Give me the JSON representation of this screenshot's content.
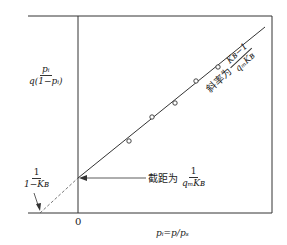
{
  "diagram": {
    "type": "linear-plot-schematic",
    "y_axis_label": {
      "numerator": "pᵢ",
      "denominator": "q(1−pᵢ)"
    },
    "x_axis_label": "pᵢ=p/pₛ",
    "origin_label": "0",
    "x_intercept_label": {
      "numerator": "1",
      "denominator": "1−Kʙ"
    },
    "intercept_annotation": {
      "text": "截距为",
      "numerator": "1",
      "denominator": "qₘKʙ"
    },
    "slope_annotation": {
      "text": "斜率为",
      "numerator": "Kʙ−1",
      "denominator": "qₘKʙ"
    },
    "data_points": [
      {
        "x": 129,
        "y": 141
      },
      {
        "x": 152,
        "y": 117
      },
      {
        "x": 175,
        "y": 103
      },
      {
        "x": 196,
        "y": 81
      },
      {
        "x": 218,
        "y": 67
      }
    ],
    "colors": {
      "line": "#333333",
      "background": "#ffffff"
    }
  }
}
